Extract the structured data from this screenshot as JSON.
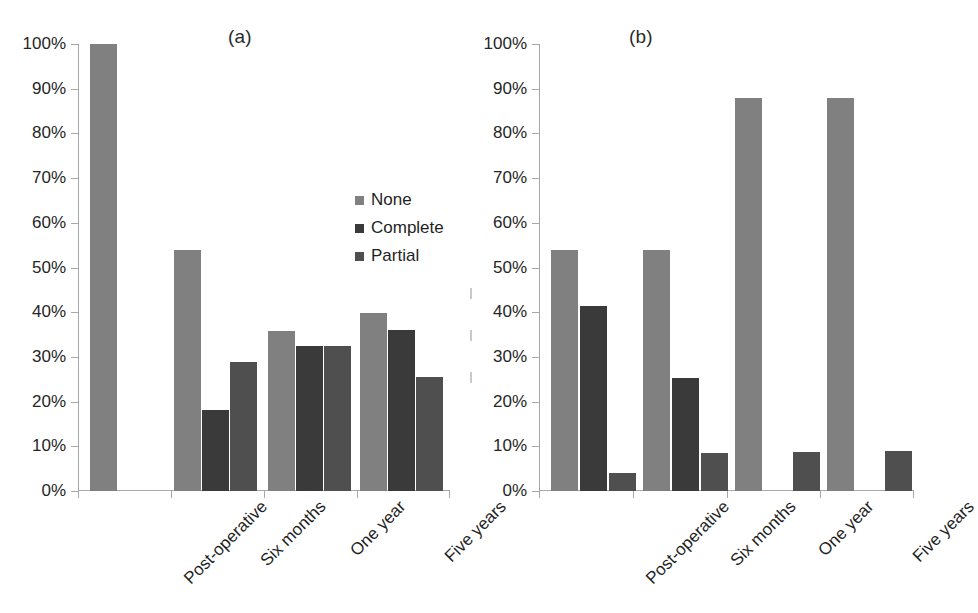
{
  "figure": {
    "background": "#ffffff"
  },
  "series_colors": {
    "None": "#808080",
    "Complete": "#3a3a3a",
    "Partial": "#4f4f4f"
  },
  "legend": {
    "position": "inside-panel-a-upper-right",
    "entries": [
      {
        "label": "None",
        "color": "#808080"
      },
      {
        "label": "Complete",
        "color": "#3a3a3a"
      },
      {
        "label": "Partial",
        "color": "#4f4f4f"
      }
    ]
  },
  "y_axis": {
    "ticks": [
      "0%",
      "10%",
      "20%",
      "30%",
      "40%",
      "50%",
      "60%",
      "70%",
      "80%",
      "90%",
      "100%"
    ],
    "min": 0,
    "max": 100
  },
  "chart_data": [
    {
      "type": "bar",
      "title": "(a)",
      "xlabel": "",
      "ylabel": "",
      "ylim": [
        0,
        100
      ],
      "grid": false,
      "legend": "upper right inside",
      "categories": [
        "Post-operative",
        "Six months",
        "One year",
        "Five years"
      ],
      "series": [
        {
          "name": "None",
          "color": "#808080",
          "values": [
            100,
            54,
            35.8,
            39.8
          ]
        },
        {
          "name": "Complete",
          "color": "#3a3a3a",
          "values": [
            0,
            18.2,
            32.4,
            36
          ]
        },
        {
          "name": "Partial",
          "color": "#4f4f4f",
          "values": [
            0,
            28.8,
            32.4,
            25.5
          ]
        }
      ]
    },
    {
      "type": "bar",
      "title": "(b)",
      "xlabel": "",
      "ylabel": "",
      "ylim": [
        0,
        100
      ],
      "grid": false,
      "legend": "none",
      "categories": [
        "Post-operative",
        "Six months",
        "One year",
        "Five years"
      ],
      "series": [
        {
          "name": "None",
          "color": "#808080",
          "values": [
            54,
            54,
            88,
            88
          ]
        },
        {
          "name": "Complete",
          "color": "#3a3a3a",
          "values": [
            41.5,
            25.2,
            0,
            0
          ]
        },
        {
          "name": "Partial",
          "color": "#4f4f4f",
          "values": [
            4.1,
            8.6,
            8.8,
            8.9
          ]
        }
      ]
    }
  ]
}
